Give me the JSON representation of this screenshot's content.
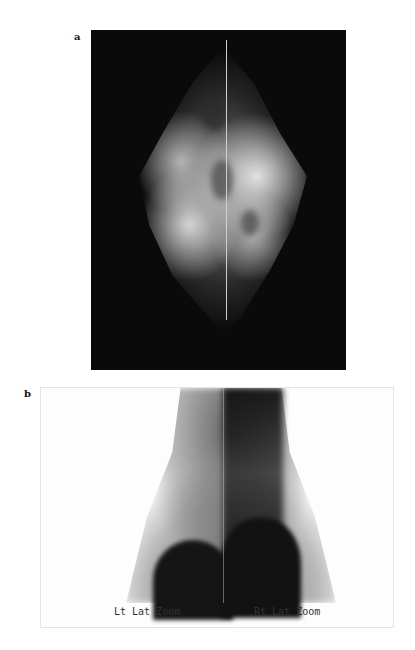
{
  "figure": {
    "panels": [
      {
        "label": "a",
        "description": "Mammogram (grayscale radiograph, dark background)"
      },
      {
        "label": "b",
        "description": "Lateral scintigraphy zoom views",
        "annotations": {
          "left": "Lt Lat Zoom",
          "right": "Rt Lat Zoom"
        }
      }
    ]
  },
  "colors": {
    "page_background": "#ffffff",
    "mammogram_background": "#0a0a0a",
    "scintigraphy_background": "#fdfdfd"
  }
}
